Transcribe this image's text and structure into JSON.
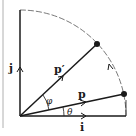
{
  "diagram": {
    "type": "vector-rotation",
    "labels": {
      "j": "j",
      "i": "i",
      "p": "p",
      "p_prime": "p′",
      "theta": "θ",
      "phi": "φ"
    },
    "geometry": {
      "origin": [
        20,
        116
      ],
      "radius": 106,
      "p_end": [
        124,
        94
      ],
      "p_prime_end": [
        97,
        44
      ]
    },
    "colors": {
      "stroke": "#1a1a1a",
      "arc": "#555555",
      "border": "#b0b0b0"
    }
  }
}
